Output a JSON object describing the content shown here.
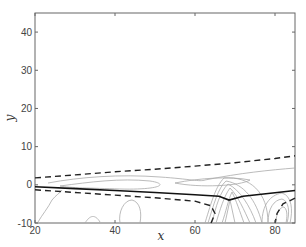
{
  "chart_data": {
    "type": "line",
    "title": "",
    "xlabel": "x",
    "ylabel": "y",
    "xlim": [
      20,
      85
    ],
    "ylim": [
      -10,
      45
    ],
    "xticks": [
      20,
      40,
      60,
      80
    ],
    "yticks": [
      -10,
      0,
      10,
      20,
      30,
      40
    ],
    "grid": false,
    "legend": null,
    "series": [
      {
        "name": "upper dashed boundary",
        "style": "dashed",
        "color": "#222222",
        "x": [
          20,
          30,
          40,
          50,
          60,
          70,
          80,
          85
        ],
        "y": [
          1.8,
          2.6,
          3.4,
          4.1,
          4.9,
          5.8,
          6.9,
          7.6
        ]
      },
      {
        "name": "solid centerline",
        "style": "solid",
        "color": "#111111",
        "x": [
          20,
          30,
          40,
          50,
          60,
          66,
          68.5,
          72,
          80,
          85
        ],
        "y": [
          -0.5,
          -1.0,
          -1.5,
          -2.0,
          -2.6,
          -3.0,
          -4.0,
          -3.0,
          -2.1,
          -1.5
        ]
      },
      {
        "name": "lower dashed boundary",
        "style": "dashed",
        "color": "#222222",
        "x": [
          20,
          30,
          40,
          50,
          60,
          64,
          65,
          64
        ],
        "y": [
          -1.3,
          -2.0,
          -2.7,
          -3.4,
          -4.3,
          -5.5,
          -7.5,
          -10
        ]
      },
      {
        "name": "lower dashed boundary (right)",
        "style": "dashed",
        "color": "#222222",
        "x": [
          85,
          82,
          80.5,
          80
        ],
        "y": [
          -3.5,
          -5.0,
          -7.5,
          -10
        ]
      },
      {
        "name": "contours",
        "style": "thin",
        "color": "#999999",
        "note": "thin gray contour lines, dense near x=64-72 and x=80-85, y<0"
      }
    ]
  },
  "labels": {
    "x_axis": "x",
    "y_axis": "y",
    "xtick_labels": [
      "20",
      "40",
      "60",
      "80"
    ],
    "ytick_labels": [
      "40",
      "30",
      "20",
      "10",
      "0",
      "-10"
    ]
  }
}
